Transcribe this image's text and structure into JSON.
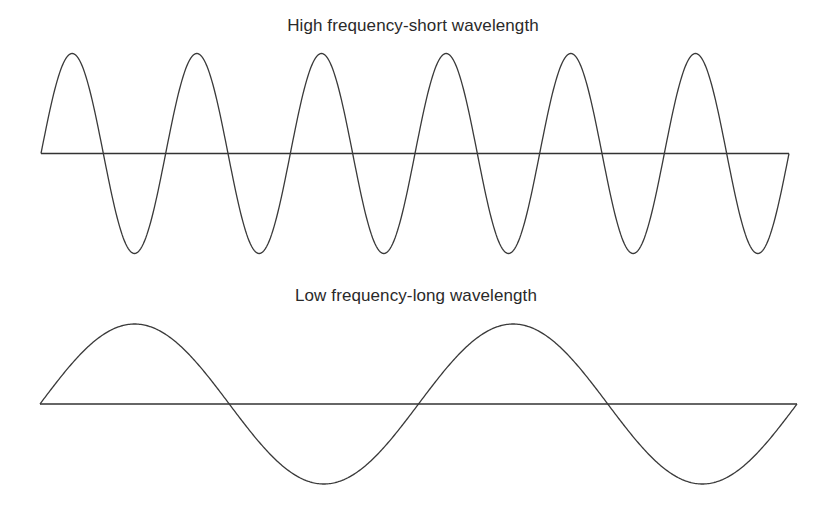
{
  "diagram": {
    "panels": [
      {
        "id": "high",
        "title": "High frequency-short wavelength",
        "axis": {
          "x_start": 41,
          "x_end": 789,
          "y": 153.5
        },
        "wave": {
          "cycles": 6,
          "amplitude": 100,
          "start_with_vertical_edge": true,
          "end_with_vertical_edge": true
        }
      },
      {
        "id": "low",
        "title": "Low frequency-long wavelength",
        "axis": {
          "x_start": 40,
          "x_end": 797,
          "y": 404
        },
        "wave": {
          "cycles": 2,
          "amplitude": 80
        }
      }
    ],
    "colors": {
      "line": "#333333",
      "text": "#2a2a2a",
      "background": "#ffffff"
    }
  }
}
